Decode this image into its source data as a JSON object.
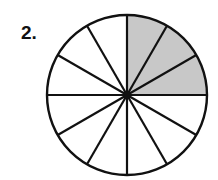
{
  "problem": {
    "number_label": "2."
  },
  "figure": {
    "shape": "circle",
    "total_parts": 12,
    "shaded_parts": 3,
    "shaded_sector_indices": [
      0,
      1,
      2
    ],
    "shaded_description": "top-right quadrant (3 of 12 equal sectors)",
    "colors": {
      "shaded": "#c8c8c8",
      "unshaded": "#ffffff",
      "stroke": "#111111"
    }
  }
}
